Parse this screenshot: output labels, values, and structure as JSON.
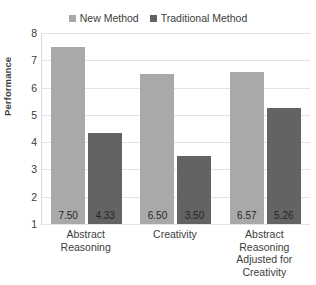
{
  "chart_data": {
    "type": "bar",
    "title": "",
    "xlabel": "",
    "ylabel": "Performance",
    "ylim": [
      1,
      8
    ],
    "yticks": [
      8,
      7,
      6,
      5,
      4,
      3,
      2,
      1
    ],
    "grid": true,
    "legend_position": "top-center",
    "categories": [
      "Abstract Reasoning",
      "Creativity",
      "Abstract Reasoning Adjusted for Creativity"
    ],
    "series": [
      {
        "name": "New Method",
        "color": "#a9a9a9",
        "values": [
          7.5,
          6.5,
          6.57
        ],
        "labels": [
          "7.50",
          "6.50",
          "6.57"
        ]
      },
      {
        "name": "Traditional Method",
        "color": "#636363",
        "values": [
          4.33,
          3.5,
          5.26
        ],
        "labels": [
          "4.33",
          "3.50",
          "5.26"
        ]
      }
    ]
  },
  "colors": {
    "new_method": "#a9a9a9",
    "traditional_method": "#636363",
    "gridline": "#e4e4e4",
    "axis": "#d9d9d9",
    "text": "#3d3d3d",
    "background": "#ffffff"
  }
}
